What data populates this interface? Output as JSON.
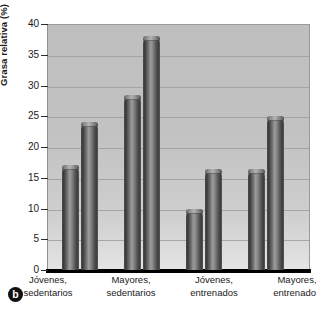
{
  "panel": {
    "letter": "b"
  },
  "axes": {
    "y_title": "Grasa relativa (%)",
    "y_ticks": [
      "40",
      "35",
      "30",
      "25",
      "20",
      "15",
      "10",
      "5",
      "0"
    ],
    "x_labels": [
      {
        "line1": "Jóvenes,",
        "line2": "sedentarios"
      },
      {
        "line1": "Mayores,",
        "line2": "sedentarios"
      },
      {
        "line1": "Jóvenes,",
        "line2": "entrenados"
      },
      {
        "line1": "Mayores,",
        "line2": "entrenados"
      }
    ]
  },
  "colors": {
    "plot_background": "#c4c4c4",
    "bar_dark": "#3a3a3a",
    "bar_light": "#b3b3b3",
    "gridline": "#9d9d9d",
    "axis": "#000000"
  },
  "chart_data": {
    "type": "bar",
    "title": "",
    "xlabel": "",
    "ylabel": "Grasa relativa (%)",
    "ylim": [
      0,
      40
    ],
    "yticks": [
      0,
      5,
      10,
      15,
      20,
      25,
      30,
      35,
      40
    ],
    "grid": true,
    "legend": "none",
    "categories": [
      "Jóvenes, sedentarios",
      "Mayores, sedentarios",
      "Jóvenes, entrenados",
      "Mayores, entrenados"
    ],
    "series": [
      {
        "name": "Serie 1",
        "values": [
          17.0,
          28.5,
          10.0,
          16.5
        ]
      },
      {
        "name": "Serie 2",
        "values": [
          24.0,
          38.0,
          16.5,
          25.0
        ]
      }
    ],
    "bars": [
      {
        "category": "Jóvenes, sedentarios",
        "series": "Serie 1",
        "value": 17.0
      },
      {
        "category": "Jóvenes, sedentarios",
        "series": "Serie 2",
        "value": 24.0
      },
      {
        "category": "Mayores, sedentarios",
        "series": "Serie 1",
        "value": 28.5
      },
      {
        "category": "Mayores, sedentarios",
        "series": "Serie 2",
        "value": 38.0
      },
      {
        "category": "Jóvenes, entrenados",
        "series": "Serie 1",
        "value": 10.0
      },
      {
        "category": "Jóvenes, entrenados",
        "series": "Serie 2",
        "value": 16.5
      },
      {
        "category": "Mayores, entrenados",
        "series": "Serie 1",
        "value": 16.5
      },
      {
        "category": "Mayores, entrenados",
        "series": "Serie 2",
        "value": 25.0
      }
    ]
  },
  "layout": {
    "bar_x": [
      14,
      33,
      76,
      95,
      138,
      157,
      200,
      219
    ],
    "cat_x": [
      48,
      131,
      214,
      297
    ]
  }
}
